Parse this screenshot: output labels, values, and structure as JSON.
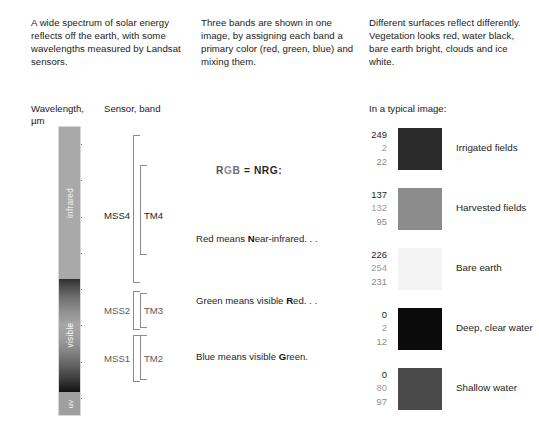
{
  "intro": {
    "col1": "A wide spectrum of solar energy reflects off the earth, with some wavelengths measured by Landsat sensors.",
    "col2": "Three bands are shown in one image, by assigning each band a primary color (red, green, blue) and mixing them.",
    "col3": "Different surfaces reflect differently. Vegetation looks red, water black, bare earth bright, clouds and ice white."
  },
  "headers": {
    "wavelength": "Wavelength,",
    "wavelength_unit": "µm",
    "sensor_band": "Sensor, band",
    "typical_image": "In a typical image:"
  },
  "axis": {
    "unit": "µm",
    "ticks": [
      {
        "label": "1.1",
        "value": 1.1
      },
      {
        "label": "1.0",
        "value": 1.0
      },
      {
        "label": ".9",
        "value": 0.9
      },
      {
        "label": ".8",
        "value": 0.8
      },
      {
        "label": ".7",
        "value": 0.7
      },
      {
        "label": ".6",
        "value": 0.6
      },
      {
        "label": ".5",
        "value": 0.5
      },
      {
        "label": ".4",
        "value": 0.4
      }
    ],
    "range": [
      0.35,
      1.15
    ]
  },
  "spectrum": {
    "segments": [
      {
        "name": "infrared",
        "label": "infrared"
      },
      {
        "name": "visible",
        "label": "visible"
      },
      {
        "name": "uv",
        "label": "uv"
      }
    ]
  },
  "sensors": {
    "groups": [
      {
        "mss": "MSS4",
        "tm": "TM4"
      },
      {
        "mss": "MSS2",
        "tm": "TM3"
      },
      {
        "mss": "MSS1",
        "tm": "TM2"
      }
    ]
  },
  "mapping": {
    "equation_r": "R",
    "equation_g": "G",
    "equation_b": "B",
    "equation_rest": " = NRG:",
    "lines": [
      {
        "prefix": "Red means ",
        "bold": "N",
        "suffix": "ear-infrared. . ."
      },
      {
        "prefix": "Green means visible ",
        "bold": "R",
        "suffix": "ed. . ."
      },
      {
        "prefix": "Blue means visible ",
        "bold": "G",
        "suffix": "reen."
      }
    ]
  },
  "samples": [
    {
      "name": "irrigated-fields",
      "label": "Irrigated fields",
      "r": "249",
      "g": "2",
      "b": "22",
      "swatch_hex": "#2b2b2b"
    },
    {
      "name": "harvested-fields",
      "label": "Harvested fields",
      "r": "137",
      "g": "132",
      "b": "95",
      "swatch_hex": "#8c8c8c"
    },
    {
      "name": "bare-earth",
      "label": "Bare earth",
      "r": "226",
      "g": "254",
      "b": "231",
      "swatch_hex": "#f3f3f3"
    },
    {
      "name": "deep-clear-water",
      "label": "Deep, clear water",
      "r": "0",
      "g": "2",
      "b": "12",
      "swatch_hex": "#0b0b0b"
    },
    {
      "name": "shallow-water",
      "label": "Shallow water",
      "r": "0",
      "g": "80",
      "b": "97",
      "swatch_hex": "#4a4a4a"
    }
  ]
}
